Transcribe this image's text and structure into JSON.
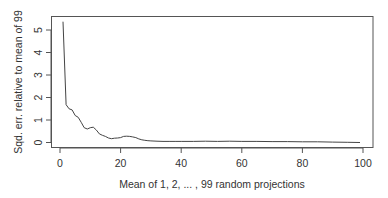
{
  "chart_data": {
    "type": "line",
    "title": "",
    "xlabel": "Mean of 1, 2, ... , 99 random projections",
    "ylabel": "Sqd. err. relative to mean of 99",
    "xlim": [
      -3,
      103
    ],
    "ylim": [
      -0.2,
      5.6
    ],
    "xticks": [
      0,
      20,
      40,
      60,
      80,
      100
    ],
    "yticks": [
      0,
      1,
      2,
      3,
      4,
      5
    ],
    "grid": false,
    "legend": null,
    "series": [
      {
        "name": "squared error",
        "color": "#444444",
        "x": [
          1,
          2,
          3,
          4,
          5,
          6,
          7,
          8,
          9,
          10,
          11,
          12,
          13,
          14,
          15,
          16,
          17,
          18,
          19,
          20,
          21,
          22,
          23,
          24,
          25,
          26,
          27,
          28,
          29,
          30,
          32,
          34,
          36,
          38,
          40,
          44,
          48,
          52,
          56,
          60,
          65,
          70,
          75,
          80,
          85,
          90,
          95,
          99
        ],
        "y": [
          5.37,
          1.68,
          1.5,
          1.45,
          1.2,
          1.12,
          0.9,
          0.66,
          0.6,
          0.66,
          0.68,
          0.55,
          0.38,
          0.32,
          0.27,
          0.2,
          0.17,
          0.19,
          0.2,
          0.22,
          0.27,
          0.28,
          0.27,
          0.25,
          0.22,
          0.16,
          0.12,
          0.1,
          0.08,
          0.07,
          0.06,
          0.05,
          0.05,
          0.05,
          0.05,
          0.05,
          0.06,
          0.05,
          0.06,
          0.05,
          0.05,
          0.04,
          0.04,
          0.03,
          0.03,
          0.02,
          0.01,
          0.0
        ]
      }
    ]
  },
  "layout": {
    "plot_box": {
      "left": 51.5,
      "top": 16.5,
      "right": 373,
      "bottom": 147.5
    },
    "x_origin_px": 60,
    "x_px_per_unit": 3.03,
    "y_origin_px": 142.5,
    "y_px_per_unit": 22.5
  }
}
